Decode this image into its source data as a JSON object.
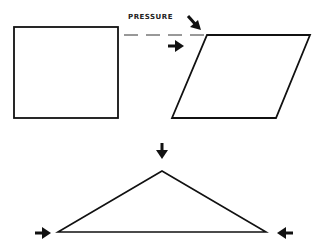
{
  "diagram": {
    "label": "PRESSURE",
    "shapes": [
      {
        "name": "square",
        "description": "original square shape"
      },
      {
        "name": "parallelogram",
        "description": "square deformed by shear pressure"
      },
      {
        "name": "triangle",
        "description": "triangle under compressive pressure"
      }
    ],
    "arrows": [
      {
        "name": "shear-arrow-diagonal",
        "direction": "down-right"
      },
      {
        "name": "shear-arrow-horizontal",
        "direction": "right"
      },
      {
        "name": "compress-arrow-top",
        "direction": "down"
      },
      {
        "name": "compress-arrow-left",
        "direction": "right"
      },
      {
        "name": "compress-arrow-right",
        "direction": "left"
      }
    ],
    "colors": {
      "stroke": "#111111",
      "background": "#ffffff"
    }
  }
}
